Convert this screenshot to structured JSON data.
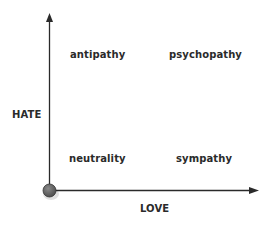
{
  "diagram": {
    "x_axis_label": "LOVE",
    "y_axis_label": "HATE",
    "quadrants": {
      "top_left": "antipathy",
      "top_right": "psychopathy",
      "bottom_left": "neutrality",
      "bottom_right": "sympathy"
    },
    "colors": {
      "axis": "#2a2a2a",
      "origin_fill": "#666666",
      "text": "#2a2a2a"
    }
  }
}
